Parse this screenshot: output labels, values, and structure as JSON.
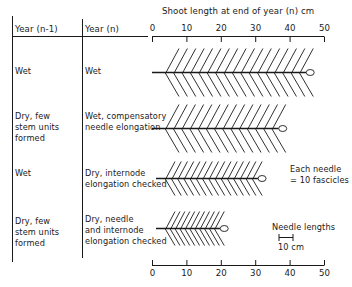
{
  "header": {
    "col_prev": "Year (n-1)",
    "col_curr": "Year (n)",
    "axis_title": "Shoot length at end of year (n)  cm"
  },
  "axis": {
    "ticks": [
      "0",
      "10",
      "20",
      "30",
      "40",
      "50"
    ],
    "min": 0,
    "max": 50,
    "unit": "cm"
  },
  "rows": [
    {
      "prev": "Wet",
      "curr": "Wet",
      "shoot_length_cm": 46,
      "needle_count": 17,
      "needle_length": "long"
    },
    {
      "prev": "Dry, few\nstem units\nformed",
      "curr": "Wet, compensatory\nneedle elongation",
      "shoot_length_cm": 38,
      "needle_count": 14,
      "needle_length": "long"
    },
    {
      "prev": "Wet",
      "curr": "Dry, internode\nelongation checked",
      "shoot_length_cm": 32,
      "needle_count": 15,
      "needle_length": "short"
    },
    {
      "prev": "Dry, few\nstem units\nformed",
      "curr": "Dry, needle\nand internode\nelongation checked",
      "shoot_length_cm": 21,
      "needle_count": 11,
      "needle_length": "short"
    }
  ],
  "legend": {
    "needle_note": "Each needle\n= 10 fascicles",
    "scale_title": "Needle lengths",
    "scale_label": "10 cm"
  },
  "colors": {
    "ink": "#1a1a1a",
    "background": "#ffffff"
  }
}
